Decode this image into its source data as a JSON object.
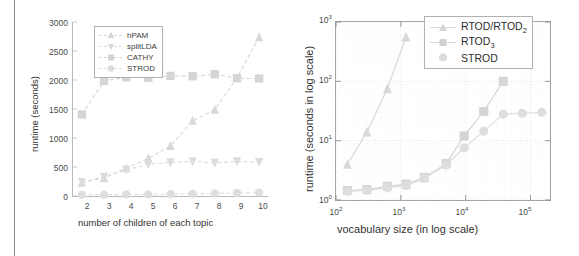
{
  "figure_caption": "",
  "colors": {
    "hpam": "#d8d8d8",
    "splitlda": "#dcdcdc",
    "cathy": "#d5d5d5",
    "strod": "#dedede",
    "axis": "#b9b9b9",
    "grid": "#ececec",
    "text": "#3a3a3a",
    "page_rule": "#8e8e8e"
  },
  "left_panel": {
    "y_axis_title": "runtime (seconds)",
    "x_axis_title": "number of children of each topic",
    "y_ticks": [
      "0",
      "500",
      "1000",
      "1500",
      "2000",
      "2500",
      "3000"
    ],
    "x_ticks": [
      "2",
      "3",
      "4",
      "5",
      "6",
      "7",
      "8",
      "9",
      "10"
    ],
    "legend": [
      {
        "label": "hPAM",
        "marker": "triangle-up"
      },
      {
        "label": "splitLDA",
        "marker": "triangle-down"
      },
      {
        "label": "CATHY",
        "marker": "square"
      },
      {
        "label": "STROD",
        "marker": "circle"
      }
    ]
  },
  "right_panel": {
    "y_axis_title": "runtime (seconds in log scale)",
    "x_axis_title": "vocabulary size (in log scale)",
    "y_ticks": [
      "10<sup>0</sup>",
      "10<sup>1</sup>",
      "10<sup>2</sup>",
      "10<sup>3</sup>"
    ],
    "x_ticks": [
      "10<sup>2</sup>",
      "10<sup>3</sup>",
      "10<sup>4</sup>",
      "10<sup>5</sup>"
    ],
    "legend": [
      {
        "label": "RTOD/RTOD",
        "sub": "2",
        "marker": "triangle-up"
      },
      {
        "label": "RTOD",
        "sub": "3",
        "marker": "square"
      },
      {
        "label": "STROD",
        "sub": "",
        "marker": "circle"
      }
    ]
  },
  "chart_data": [
    {
      "type": "line",
      "id": "left-panel",
      "title": "",
      "xlabel": "number of children of each topic",
      "ylabel": "runtime (seconds)",
      "x": [
        2,
        3,
        4,
        5,
        6,
        7,
        8,
        9,
        10
      ],
      "xlim": [
        1.6,
        10.4
      ],
      "ylim": [
        0,
        3000
      ],
      "xscale": "linear",
      "yscale": "linear",
      "grid": false,
      "legend_position": "upper-left",
      "series": [
        {
          "name": "hPAM",
          "marker": "triangle-up",
          "values": [
            230,
            310,
            480,
            650,
            865,
            1300,
            1490,
            2040,
            2740
          ]
        },
        {
          "name": "splitLDA",
          "marker": "triangle-down",
          "values": [
            240,
            330,
            450,
            545,
            580,
            595,
            570,
            595,
            585
          ]
        },
        {
          "name": "CATHY",
          "marker": "square",
          "values": [
            1405,
            1985,
            2045,
            2040,
            2070,
            2065,
            2100,
            2030,
            2025
          ]
        },
        {
          "name": "STROD",
          "marker": "circle",
          "values": [
            20,
            22,
            25,
            28,
            32,
            38,
            44,
            52,
            58
          ]
        }
      ]
    },
    {
      "type": "line",
      "id": "right-panel",
      "title": "",
      "xlabel": "vocabulary size (in log scale)",
      "ylabel": "runtime (seconds in log scale)",
      "xlim": [
        100,
        200000
      ],
      "ylim": [
        1,
        1000
      ],
      "xscale": "log",
      "yscale": "log",
      "grid": true,
      "legend_position": "upper-right",
      "series": [
        {
          "name": "RTOD/RTOD2",
          "marker": "triangle-up",
          "points": [
            [
              150,
              4.0
            ],
            [
              300,
              14.0
            ],
            [
              620,
              75.0
            ],
            [
              1200,
              560.0
            ]
          ]
        },
        {
          "name": "RTOD3",
          "marker": "square",
          "points": [
            [
              150,
              1.45
            ],
            [
              300,
              1.5
            ],
            [
              620,
              1.7
            ],
            [
              1200,
              1.85
            ],
            [
              2300,
              2.4
            ],
            [
              5000,
              4.1
            ],
            [
              9500,
              12.0
            ],
            [
              19000,
              31.0
            ],
            [
              38000,
              100.0
            ]
          ]
        },
        {
          "name": "STROD",
          "marker": "circle",
          "points": [
            [
              150,
              1.4
            ],
            [
              300,
              1.45
            ],
            [
              620,
              1.6
            ],
            [
              1200,
              1.75
            ],
            [
              2300,
              2.3
            ],
            [
              5000,
              3.9
            ],
            [
              9500,
              7.6
            ],
            [
              19000,
              14.5
            ],
            [
              38000,
              28.0
            ],
            [
              75000,
              29.0
            ],
            [
              150000,
              30.0
            ]
          ]
        }
      ]
    }
  ]
}
